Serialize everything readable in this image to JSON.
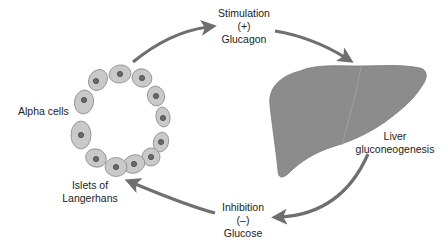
{
  "diagram": {
    "colors": {
      "arrow": "#6f6f6f",
      "cell_fill": "#c9c9c9",
      "cell_stroke": "#8a8a8a",
      "nucleus_fill": "#6a6a6a",
      "nucleus_ring": "#444444",
      "liver_fill": "#8c8c8c",
      "liver_stroke": "#7a7a7a",
      "text": "#222222"
    },
    "labels": {
      "stimulation": {
        "line1": "Stimulation",
        "line2": "(+)",
        "line3": "Glucagon"
      },
      "alpha_cells": "Alpha cells",
      "islets": {
        "line1": "Islets of",
        "line2": "Langerhans"
      },
      "liver": {
        "line1": "Liver",
        "line2": "gluconeogenesis"
      },
      "inhibition": {
        "line1": "Inhibition",
        "line2": "(–)",
        "line3": "Glucose"
      }
    },
    "nodes": [
      {
        "id": "islets",
        "name": "Islets of Langerhans (Alpha cells)"
      },
      {
        "id": "liver",
        "name": "Liver gluconeogenesis"
      }
    ],
    "edges": [
      {
        "from": "islets",
        "to": "liver",
        "label": "Stimulation (+) Glucagon"
      },
      {
        "from": "liver",
        "to": "islets",
        "label": "Inhibition (–) Glucose"
      }
    ],
    "cell_count": 12
  }
}
